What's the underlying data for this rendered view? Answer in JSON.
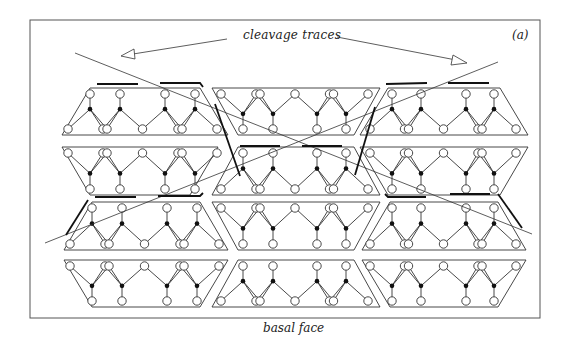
{
  "figure": {
    "panel_label": "(a)",
    "labels": {
      "cleavage_traces": "cleavage traces",
      "basal_face": "basal face"
    },
    "colors": {
      "line": "#333333",
      "frame": "#555555",
      "background": "#ffffff",
      "filled_atom": "#111111",
      "open_atom_fill": "#ffffff"
    },
    "layout": {
      "rows": 4,
      "columns": 3,
      "legend_symbols": [
        {
          "symbol": "open-circle",
          "meaning": "oxygen"
        },
        {
          "symbol": "filled-dot",
          "meaning": "silicon"
        }
      ]
    }
  }
}
